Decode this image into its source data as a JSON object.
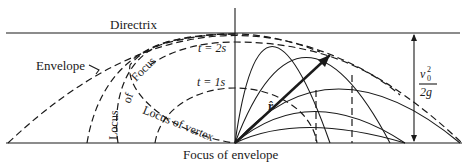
{
  "figure": {
    "type": "projectile-trajectories-envelope-diagram",
    "labels": {
      "directrix": "Directrix",
      "envelope": "Envelope",
      "locus_of_focus": "Locus of Focus",
      "locus_of_focus_part1": "Locus",
      "locus_of_focus_part2": "of",
      "locus_of_focus_part3": "Focus",
      "locus_of_vertex": "Locus of vertex",
      "time_2s": "t = 2s",
      "time_1s": "t = 1s",
      "focus_of_envelope": "Focus of envelope",
      "unit_vector": "r̂",
      "height_numerator": "v",
      "height_numerator_sub": "0",
      "height_numerator_sup": "2",
      "height_denominator": "2g"
    },
    "colors": {
      "ink": "#1a1a1a",
      "background": "#ffffff"
    }
  }
}
